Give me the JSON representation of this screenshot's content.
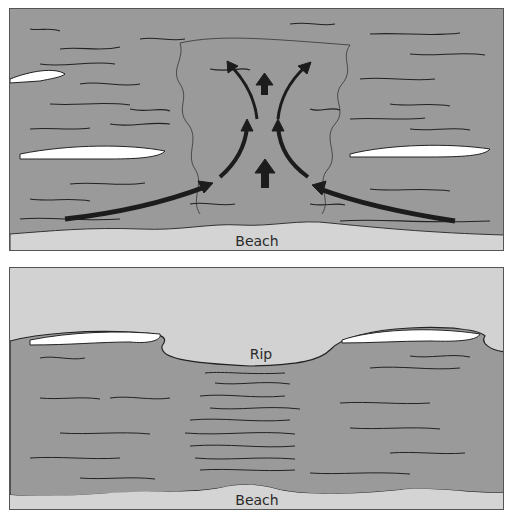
{
  "colors": {
    "water": "#9a9a9a",
    "beach": "#d4d4d4",
    "sky": "#d2d2d2",
    "foam": "#ffffff",
    "arrow": "#1c1c1c",
    "line": "#222222"
  },
  "top_panel": {
    "view": "plan view of rip current",
    "beach_label": "Beach",
    "arrows": [
      "feeder-current-left",
      "feeder-current-right",
      "rip-neck-up",
      "rip-head-left",
      "rip-head-right"
    ]
  },
  "bottom_panel": {
    "view": "perspective view of rip current",
    "rip_label": "Rip",
    "beach_label": "Beach"
  }
}
